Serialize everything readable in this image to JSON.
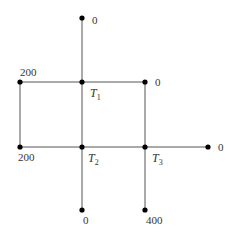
{
  "diagram": {
    "type": "network-graph",
    "colors": {
      "edge": "#555555",
      "node": "#000000",
      "text": "#333333"
    },
    "nodes": [
      {
        "id": "top",
        "x": 82,
        "y": 18,
        "label": "0",
        "lx": 92,
        "ly": 24
      },
      {
        "id": "T1",
        "x": 82,
        "y": 82,
        "label_main": "T",
        "label_sub": "1",
        "lx": 90,
        "ly": 97
      },
      {
        "id": "left-top",
        "x": 20,
        "y": 82,
        "label": "200",
        "lx": 20,
        "ly": 76
      },
      {
        "id": "right-top",
        "x": 145,
        "y": 82,
        "label": "0",
        "lx": 155,
        "ly": 86
      },
      {
        "id": "left-bottom",
        "x": 20,
        "y": 147,
        "label": "200",
        "lx": 18,
        "ly": 161
      },
      {
        "id": "T2",
        "x": 82,
        "y": 147,
        "label_main": "T",
        "label_sub": "2",
        "lx": 88,
        "ly": 162
      },
      {
        "id": "T3",
        "x": 145,
        "y": 147,
        "label_main": "T",
        "label_sub": "3",
        "lx": 152,
        "ly": 162
      },
      {
        "id": "right",
        "x": 208,
        "y": 147,
        "label": "0",
        "lx": 218,
        "ly": 151
      },
      {
        "id": "bottom-T2",
        "x": 82,
        "y": 210,
        "label": "0",
        "lx": 83,
        "ly": 224
      },
      {
        "id": "bottom-T3",
        "x": 145,
        "y": 210,
        "label": "400",
        "lx": 146,
        "ly": 224
      }
    ],
    "edges": [
      [
        "top",
        "T1"
      ],
      [
        "left-top",
        "T1"
      ],
      [
        "T1",
        "right-top"
      ],
      [
        "T1",
        "T2"
      ],
      [
        "left-top",
        "left-bottom"
      ],
      [
        "left-bottom",
        "T2"
      ],
      [
        "T2",
        "T3"
      ],
      [
        "T3",
        "right"
      ],
      [
        "right-top",
        "T3"
      ],
      [
        "T2",
        "bottom-T2"
      ],
      [
        "T3",
        "bottom-T3"
      ]
    ]
  }
}
